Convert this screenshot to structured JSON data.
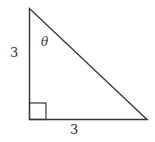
{
  "diagram": {
    "type": "right-triangle",
    "vertical_side_label": "3",
    "horizontal_side_label": "3",
    "angle_label": "θ",
    "stroke_color": "#333333"
  }
}
